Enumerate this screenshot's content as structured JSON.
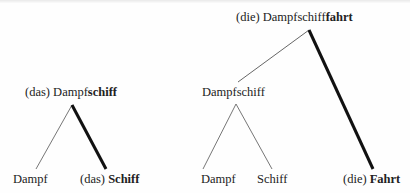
{
  "diagram": {
    "type": "morphological-tree",
    "trees": [
      {
        "root": {
          "prefix": "(das) Dampf",
          "bold": "schiff"
        },
        "children": [
          {
            "prefix": "Dampf",
            "bold": "",
            "edge": "thin"
          },
          {
            "prefix": "(das) ",
            "bold": "Schiff",
            "edge": "thick"
          }
        ]
      },
      {
        "root": {
          "prefix": "(die) Dampfschiff",
          "bold": "fahrt"
        },
        "children": [
          {
            "prefix": "Dampfschiff",
            "bold": "",
            "edge": "thin",
            "children": [
              {
                "prefix": "Dampf",
                "bold": "",
                "edge": "thin"
              },
              {
                "prefix": "Schiff",
                "bold": "",
                "edge": "thin"
              }
            ]
          },
          {
            "prefix": "(die) ",
            "bold": "Fahrt",
            "edge": "thick"
          }
        ]
      }
    ]
  },
  "colors": {
    "text": "#222222",
    "edge_thin": "#555555",
    "edge_thick": "#111111",
    "background": "#fefefe"
  }
}
